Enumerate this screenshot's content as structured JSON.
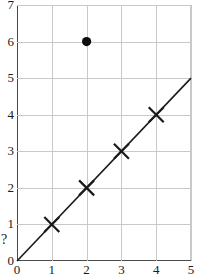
{
  "chart_data": {
    "type": "scatter",
    "title": "",
    "xlabel": "",
    "ylabel": "",
    "xlim": [
      0,
      5
    ],
    "ylim": [
      0,
      7
    ],
    "grid": true,
    "legend": "none",
    "xticks": [
      "0",
      "1",
      "2",
      "3",
      "4",
      "5"
    ],
    "xtick_values": [
      0,
      1,
      2,
      3,
      4,
      5
    ],
    "yticks": [
      "0",
      "1",
      "2",
      "3",
      "4",
      "5",
      "6",
      "7"
    ],
    "ytick_values": [
      0,
      1,
      2,
      3,
      4,
      5,
      6,
      7
    ],
    "extra_axis_annotation": "?",
    "extra_axis_annotation_value": 0.55,
    "series": [
      {
        "name": "cross-points",
        "marker": "x",
        "color": "#1a1a1a",
        "x": [
          1,
          2,
          3,
          4
        ],
        "y": [
          1,
          2,
          3,
          4
        ]
      },
      {
        "name": "outlier-point",
        "marker": "filled-circle",
        "color": "#0d0d0d",
        "x": [
          2
        ],
        "y": [
          6
        ]
      }
    ],
    "fit_line": {
      "name": "identity-line",
      "from": [
        0,
        0
      ],
      "to": [
        5,
        5
      ],
      "slope": 1,
      "intercept": 0,
      "color": "#1a1a1a"
    }
  },
  "colors": {
    "grid": "#c9c9c9",
    "axis": "#4a4a4a",
    "ink": "#1a1a1a",
    "background": "#ffffff"
  }
}
